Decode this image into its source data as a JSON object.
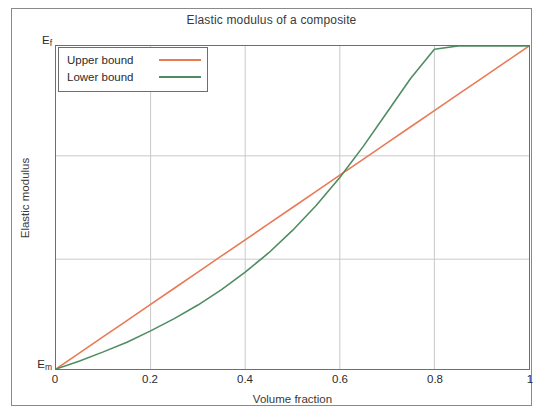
{
  "chart_data": {
    "type": "line",
    "title": "Elastic modulus of a composite",
    "xlabel": "Volume fraction",
    "ylabel": "Elastic modulus",
    "xlim": [
      0,
      1
    ],
    "ylim": [
      0,
      1
    ],
    "xticks": [
      "0",
      "0.2",
      "0.4",
      "0.6",
      "0.8",
      "1"
    ],
    "xtick_values": [
      0,
      0.2,
      0.4,
      0.6,
      0.8,
      1
    ],
    "ytick_labels": [
      "E_m",
      "E_f"
    ],
    "ytick_top_base": "E",
    "ytick_top_sub": "f",
    "ytick_bottom_base": "E",
    "ytick_bottom_sub": "m",
    "ytick_values": [
      0,
      1
    ],
    "grid": true,
    "grid_x_values": [
      0.2,
      0.4,
      0.6,
      0.8
    ],
    "grid_y_values": [
      0.34,
      0.66
    ],
    "legend_position": "upper left",
    "x": [
      0,
      0.05,
      0.1,
      0.15,
      0.2,
      0.25,
      0.3,
      0.35,
      0.4,
      0.45,
      0.5,
      0.55,
      0.6,
      0.65,
      0.7,
      0.75,
      0.8,
      0.85,
      0.9,
      0.95,
      1
    ],
    "series": [
      {
        "name": "Upper bound",
        "color": "#e87a55",
        "values": [
          0,
          0.05,
          0.1,
          0.15,
          0.2,
          0.25,
          0.3,
          0.35,
          0.4,
          0.45,
          0.5,
          0.55,
          0.6,
          0.65,
          0.7,
          0.75,
          0.8,
          0.85,
          0.9,
          0.95,
          1
        ]
      },
      {
        "name": "Lower bound",
        "color": "#4f8c63",
        "values": [
          0,
          0.025,
          0.053,
          0.083,
          0.118,
          0.156,
          0.198,
          0.246,
          0.3,
          0.36,
          0.429,
          0.506,
          0.593,
          0.69,
          0.795,
          0.9,
          0.99,
          1.0,
          1.0,
          1.0,
          1.0
        ]
      }
    ]
  },
  "legend": {
    "entries": [
      {
        "label": "Upper bound",
        "color": "#e87a55"
      },
      {
        "label": "Lower bound",
        "color": "#4f8c63"
      }
    ]
  },
  "colors": {
    "upper_bound": "#e87a55",
    "lower_bound": "#4f8c63",
    "axis": "#6e6e6e",
    "grid": "#c9c9c9",
    "frame": "#8a8a8a",
    "text": "#2b2b2b",
    "background": "#ffffff"
  }
}
